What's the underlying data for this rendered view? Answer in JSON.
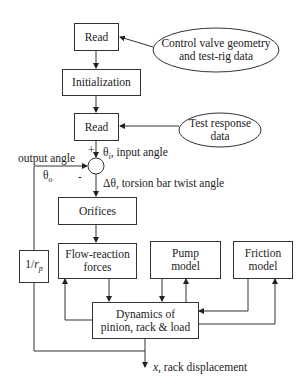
{
  "diagram": {
    "nodes": {
      "read1": {
        "label": "Read"
      },
      "geometry_input": {
        "line1": "Control valve geometry",
        "line2": "and test-rig data"
      },
      "initialization": {
        "label": "Initialization"
      },
      "read2": {
        "label": "Read"
      },
      "test_input": {
        "line1": "Test response",
        "line2": "data"
      },
      "orifices": {
        "label": "Orifices"
      },
      "ratio": {
        "prefix": "1/",
        "symbol": "r",
        "sub": "p"
      },
      "flow_reaction": {
        "line1": "Flow-reaction",
        "line2": "forces"
      },
      "pump": {
        "line1": "Pump",
        "line2": "model"
      },
      "friction": {
        "line1": "Friction",
        "line2": "model"
      },
      "dynamics": {
        "line1": "Dynamics of",
        "line2": "pinion, rack & load"
      }
    },
    "labels": {
      "plus": "+",
      "minus": "-",
      "input_angle_symbol": "θ",
      "input_angle_sub": "i",
      "input_angle_text": ", input angle",
      "output_angle": "output angle",
      "output_angle_symbol": "θ",
      "output_angle_sub": "o",
      "twist_angle": "Δθ, torsion bar twist angle",
      "rack_symbol": "x",
      "rack_text": ", rack displacement"
    }
  }
}
